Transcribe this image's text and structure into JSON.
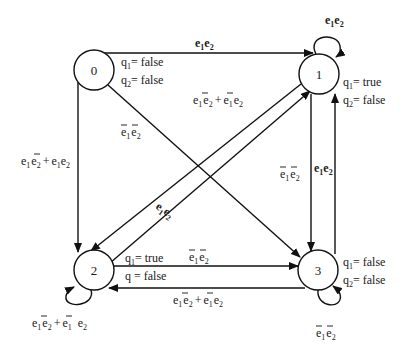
{
  "diagram": {
    "type": "state-transition-diagram",
    "nodes": [
      {
        "id": "0",
        "label": "0",
        "cx": 94,
        "cy": 70,
        "outputs": [
          "q1= false",
          "q2= false"
        ]
      },
      {
        "id": "1",
        "label": "1",
        "cx": 319,
        "cy": 74,
        "outputs": [
          "q1 = true",
          "q2= false"
        ]
      },
      {
        "id": "2",
        "label": "2",
        "cx": 94,
        "cy": 270,
        "outputs": [
          "q1 = true",
          "q = false"
        ]
      },
      {
        "id": "3",
        "label": "3",
        "cx": 318,
        "cy": 270,
        "outputs": [
          "q1 = false",
          "q2 = false"
        ]
      }
    ],
    "edges": [
      {
        "from": "0",
        "to": "1",
        "label": "e1e2",
        "bold": true
      },
      {
        "from": "0",
        "to": "2",
        "label": "e1ē2 + e1e2"
      },
      {
        "from": "0",
        "to": "3",
        "label": "ē1ē2"
      },
      {
        "from": "2",
        "to": "1",
        "label": "e1ē2 + ē1e2"
      },
      {
        "from": "1",
        "to": "2",
        "label": "e1e2",
        "bold": true
      },
      {
        "from": "1",
        "to": "3",
        "label": "ē1ē2"
      },
      {
        "from": "3",
        "to": "1",
        "label": "e1e2",
        "bold": true
      },
      {
        "from": "2",
        "to": "3",
        "label": "ē1ē2"
      },
      {
        "from": "3",
        "to": "2",
        "label": "e1ē2 + ē1e2"
      },
      {
        "from": "1",
        "to": "1",
        "label": "e1e2",
        "bold": true
      },
      {
        "from": "2",
        "to": "2",
        "label": "e1ē2 + ē1 e2"
      },
      {
        "from": "3",
        "to": "3",
        "label": "ē1ē2"
      }
    ]
  },
  "text": {
    "node0": "0",
    "node1": "1",
    "node2": "2",
    "node3": "3",
    "q": "q",
    "e": "e",
    "sub1": "1",
    "sub2": "2",
    "plus": "+",
    "eq_false": "= false",
    "eq_true": "= true",
    "eq_false_tight": "= false",
    "q_eq_false": "q  = false"
  }
}
